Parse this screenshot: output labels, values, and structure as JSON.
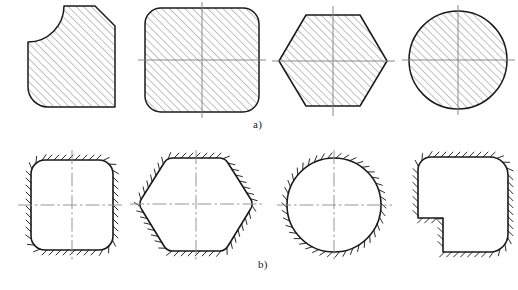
{
  "figure": {
    "title": "",
    "background_color": "#ffffff",
    "outline_color": "#1a1a1a",
    "hatch_color": "#6b6b6b",
    "centerline_color": "#8a8a8a",
    "width": 518,
    "height": 290,
    "captions": [
      {
        "id": "cap-a",
        "label": "a)",
        "x": 253,
        "y": 118
      },
      {
        "id": "cap-b",
        "label": "b)",
        "x": 258,
        "y": 258
      }
    ],
    "rows": [
      {
        "id": "row-a",
        "label": "a)",
        "hatching": "internal-45-degree",
        "description": "Cross sections shown with internal 45 degree section hatching",
        "shapes": [
          {
            "id": "shape-a1",
            "name": "rounded-square-with-chamfer",
            "centerlines": false,
            "cx": 72,
            "cy": 60
          },
          {
            "id": "shape-a2",
            "name": "rounded-square",
            "centerlines": true,
            "cx": 202,
            "cy": 60
          },
          {
            "id": "shape-a3",
            "name": "hexagon",
            "centerlines": true,
            "cx": 333,
            "cy": 60
          },
          {
            "id": "shape-a4",
            "name": "circle",
            "centerlines": true,
            "cx": 458,
            "cy": 60
          }
        ]
      },
      {
        "id": "row-b",
        "label": "b)",
        "hatching": "external-tick-marks",
        "description": "Same profiles shown with external boundary tick hatching",
        "shapes": [
          {
            "id": "shape-b1",
            "name": "rounded-square",
            "centerlines": true,
            "cx": 72,
            "cy": 205
          },
          {
            "id": "shape-b2",
            "name": "hexagon",
            "centerlines": true,
            "cx": 196,
            "cy": 205
          },
          {
            "id": "shape-b3",
            "name": "circle",
            "centerlines": true,
            "cx": 334,
            "cy": 205
          },
          {
            "id": "shape-b4",
            "name": "notched-rounded-rectangle",
            "centerlines": false,
            "cx": 458,
            "cy": 205
          }
        ]
      }
    ]
  }
}
